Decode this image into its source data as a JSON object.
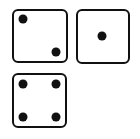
{
  "dice": [
    {
      "value": 2,
      "box": {
        "left": 12,
        "top": 9,
        "width": 56,
        "height": 54
      },
      "pips": [
        {
          "x": 11,
          "y": 10
        },
        {
          "x": 44,
          "y": 43
        }
      ]
    },
    {
      "value": 1,
      "box": {
        "left": 76,
        "top": 9,
        "width": 54,
        "height": 55
      },
      "pips": [
        {
          "x": 26,
          "y": 27
        }
      ]
    },
    {
      "value": 4,
      "box": {
        "left": 12,
        "top": 73,
        "width": 55,
        "height": 55
      },
      "pips": [
        {
          "x": 11,
          "y": 11
        },
        {
          "x": 44,
          "y": 11
        },
        {
          "x": 11,
          "y": 44
        },
        {
          "x": 44,
          "y": 44
        }
      ]
    }
  ],
  "colors": {
    "outline": "#111111",
    "pip": "#111111",
    "face": "#ffffff",
    "background": "#ffffff"
  }
}
